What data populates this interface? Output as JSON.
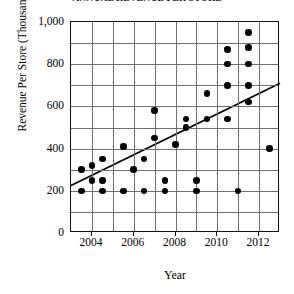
{
  "chart_data": {
    "type": "scatter",
    "title": "ANNUAL REVENUE PER STORE",
    "xlabel": "Year",
    "ylabel": "Revenue Per Store (Thousands of $)",
    "xlim": [
      2003,
      2013
    ],
    "ylim": [
      0,
      1000
    ],
    "xticks": [
      2004,
      2006,
      2008,
      2010,
      2012
    ],
    "xtick_labels": [
      "2004",
      "2006",
      "2008",
      "2010",
      "2012"
    ],
    "yticks": [
      0,
      200,
      400,
      600,
      800,
      1000
    ],
    "ytick_labels": [
      "0",
      "200",
      "400",
      "600",
      "800",
      "1,000"
    ],
    "grid": true,
    "grid_x_step": 1,
    "grid_y_step": 100,
    "legend": null,
    "marker": "filled-circle",
    "marker_color": "#000000",
    "points": [
      {
        "x": 2003.5,
        "y": 200
      },
      {
        "x": 2003.5,
        "y": 300
      },
      {
        "x": 2004.0,
        "y": 250
      },
      {
        "x": 2004.0,
        "y": 320
      },
      {
        "x": 2004.5,
        "y": 200
      },
      {
        "x": 2004.5,
        "y": 250
      },
      {
        "x": 2004.5,
        "y": 350
      },
      {
        "x": 2005.5,
        "y": 200
      },
      {
        "x": 2005.5,
        "y": 410
      },
      {
        "x": 2006.0,
        "y": 300
      },
      {
        "x": 2006.5,
        "y": 200
      },
      {
        "x": 2006.5,
        "y": 350
      },
      {
        "x": 2007.0,
        "y": 580
      },
      {
        "x": 2007.0,
        "y": 450
      },
      {
        "x": 2007.5,
        "y": 200
      },
      {
        "x": 2007.5,
        "y": 250
      },
      {
        "x": 2008.0,
        "y": 420
      },
      {
        "x": 2008.5,
        "y": 500
      },
      {
        "x": 2008.5,
        "y": 540
      },
      {
        "x": 2009.0,
        "y": 200
      },
      {
        "x": 2009.0,
        "y": 250
      },
      {
        "x": 2009.5,
        "y": 660
      },
      {
        "x": 2009.5,
        "y": 540
      },
      {
        "x": 2010.5,
        "y": 700
      },
      {
        "x": 2010.5,
        "y": 540
      },
      {
        "x": 2010.5,
        "y": 800
      },
      {
        "x": 2010.5,
        "y": 870
      },
      {
        "x": 2011.0,
        "y": 200
      },
      {
        "x": 2011.5,
        "y": 950
      },
      {
        "x": 2011.5,
        "y": 880
      },
      {
        "x": 2011.5,
        "y": 800
      },
      {
        "x": 2011.5,
        "y": 700
      },
      {
        "x": 2011.5,
        "y": 620
      },
      {
        "x": 2012.5,
        "y": 400
      }
    ],
    "trendline": {
      "visible": true,
      "x_start": 2003,
      "y_start": 225,
      "x_end": 2013,
      "y_end": 710
    }
  }
}
